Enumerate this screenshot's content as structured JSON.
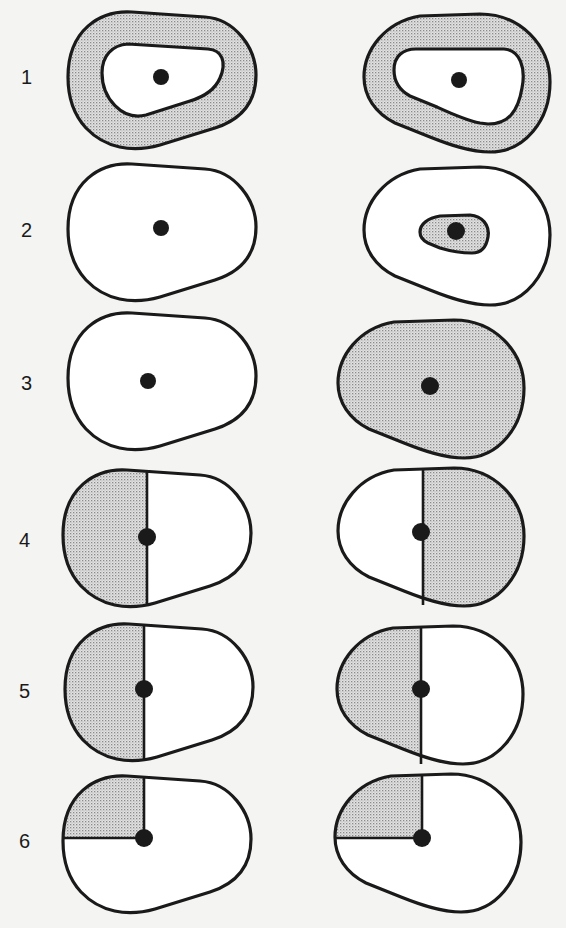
{
  "figure": {
    "shading_color": "#c8c8c8",
    "line_color": "#1a1a1a",
    "rows": [
      {
        "label": "1",
        "left": "outer ring shaded, inner region white with dot",
        "right": "outer ring shaded, inner region white with dot"
      },
      {
        "label": "2",
        "left": "unshaded shape with dot",
        "right": "unshaded shape with small shaded inner region around dot"
      },
      {
        "label": "3",
        "left": "unshaded shape with dot",
        "right": "fully shaded shape with dot"
      },
      {
        "label": "4",
        "left": "left half shaded, vertical divider through dot",
        "right": "right half shaded, vertical divider through dot"
      },
      {
        "label": "5",
        "left": "left half shaded, vertical divider through dot",
        "right": "left half shaded, vertical divider through dot"
      },
      {
        "label": "6",
        "left": "upper-left quadrant shaded",
        "right": "upper-left quadrant shaded"
      }
    ]
  }
}
